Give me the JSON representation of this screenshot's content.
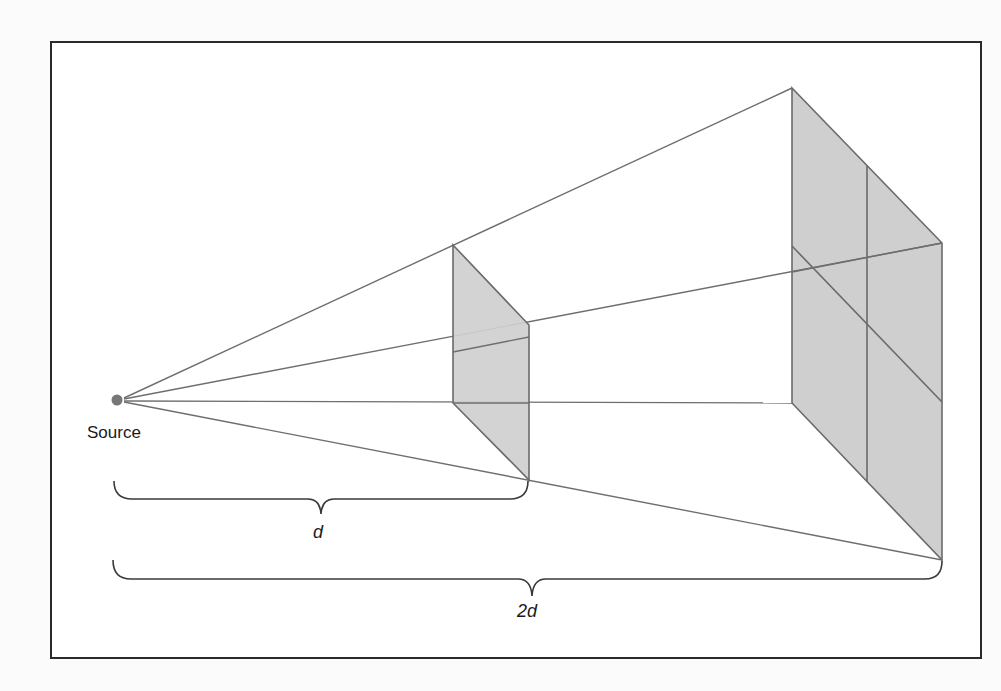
{
  "diagram": {
    "type": "inverse-square-law illustration",
    "source_label": "Source",
    "near_distance_label": "d",
    "far_distance_label": "2d",
    "colors": {
      "background": "#fbfbfb",
      "frame": "#2a2a2a",
      "ray": "#6e6e6e",
      "panel_fill": "#cfcfcf",
      "panel_edge": "#6a6a6a",
      "source_dot": "#777777",
      "brace": "#3a3a3a"
    },
    "source": {
      "x": 117,
      "y": 400
    },
    "near_panel": {
      "top_left": [
        453,
        245
      ],
      "top_right": [
        529,
        325
      ],
      "bottom_right": [
        529,
        480
      ],
      "bottom_left": [
        453,
        403
      ]
    },
    "far_panel": {
      "top_left": [
        792,
        88
      ],
      "top_right": [
        942,
        243
      ],
      "bottom_right": [
        942,
        560
      ],
      "bottom_left": [
        792,
        403
      ],
      "mid_vertical": [
        [
          867,
          166
        ],
        [
          867,
          482
        ]
      ],
      "mid_diagonal": [
        [
          792,
          246
        ],
        [
          942,
          402
        ]
      ]
    }
  }
}
